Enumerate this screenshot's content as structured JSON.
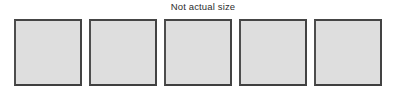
{
  "figure": {
    "caption": "Not actual size",
    "background_color": "#ffffff",
    "caption_color": "#2e2e2e",
    "swatch_fill_color": "#dedede",
    "swatch_border_color": "#454545",
    "swatches": [
      {
        "label": ""
      },
      {
        "label": ""
      },
      {
        "label": ""
      },
      {
        "label": ""
      },
      {
        "label": ""
      }
    ]
  }
}
